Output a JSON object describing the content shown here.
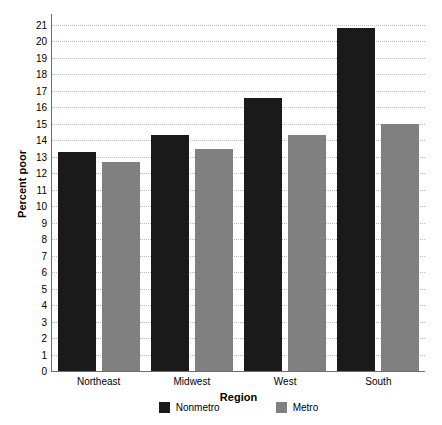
{
  "chart_data": {
    "type": "bar",
    "title": "",
    "xlabel": "Region",
    "ylabel": "Percent poor",
    "categories": [
      "Northeast",
      "Midwest",
      "West",
      "South"
    ],
    "series": [
      {
        "name": "Nonmetro",
        "color": "#1a1a1a",
        "values": [
          13.3,
          14.3,
          16.6,
          20.8
        ]
      },
      {
        "name": "Metro",
        "color": "#808080",
        "values": [
          12.7,
          13.5,
          14.3,
          15.0
        ]
      }
    ],
    "ylim": [
      0,
      21
    ],
    "ytick_labels": [
      "0",
      "1",
      "2",
      "3",
      "4",
      "5",
      "6",
      "7",
      "8",
      "9",
      "10",
      "11",
      "12",
      "13",
      "14",
      "15",
      "16",
      "17",
      "18",
      "19",
      "20",
      "21"
    ],
    "ytick_values": [
      0,
      1,
      2,
      3,
      4,
      5,
      6,
      7,
      8,
      9,
      10,
      11,
      12,
      13,
      14,
      15,
      16,
      17,
      18,
      19,
      20,
      21
    ],
    "grid": true,
    "grid_axis": "y",
    "legend_position": "bottom"
  },
  "legend": {
    "items": [
      {
        "label": "Nonmetro"
      },
      {
        "label": "Metro"
      }
    ]
  },
  "colors": {
    "nonmetro": "#1a1a1a",
    "metro": "#808080",
    "gridline": "#b9b9b9",
    "axis": "#6e6e6e",
    "background": "#ffffff"
  }
}
